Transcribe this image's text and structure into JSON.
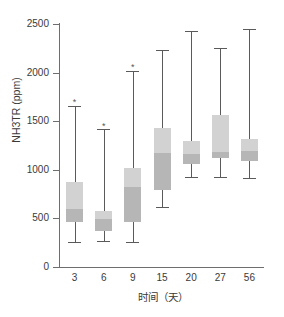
{
  "chart_data": {
    "type": "box",
    "title": "",
    "xlabel": "时间（天）",
    "ylabel": "NH3TR (ppm)",
    "ylim": [
      0,
      2500
    ],
    "yticks": [
      0,
      500,
      1000,
      1500,
      2000,
      2500
    ],
    "ytick_labels": [
      "0",
      "500",
      "1000",
      "1500",
      "2000",
      "2500"
    ],
    "categories": [
      "3",
      "6",
      "9",
      "15",
      "20",
      "27",
      "56"
    ],
    "grid": false,
    "legend": "none",
    "colors": {
      "box_upper": "#d2d2d2",
      "box_lower": "#b6b6b6",
      "line": "#5a5a5a",
      "axis": "#6e6e6e",
      "text": "#3a3a3a",
      "background": "#ffffff"
    },
    "boxes": [
      {
        "category": "3",
        "whisker_low": 260,
        "q1": 460,
        "median": 600,
        "q3": 870,
        "whisker_high": 1655,
        "outliers": [
          1715
        ]
      },
      {
        "category": "6",
        "whisker_low": 270,
        "q1": 375,
        "median": 490,
        "q3": 580,
        "whisker_high": 1415,
        "outliers": [
          1470
        ]
      },
      {
        "category": "9",
        "whisker_low": 255,
        "q1": 460,
        "median": 825,
        "q3": 1020,
        "whisker_high": 2015,
        "outliers": [
          2075
        ]
      },
      {
        "category": "15",
        "whisker_low": 620,
        "q1": 790,
        "median": 1175,
        "q3": 1430,
        "whisker_high": 2230,
        "outliers": []
      },
      {
        "category": "20",
        "whisker_low": 925,
        "q1": 1060,
        "median": 1165,
        "q3": 1300,
        "whisker_high": 2430,
        "outliers": []
      },
      {
        "category": "27",
        "whisker_low": 930,
        "q1": 1125,
        "median": 1180,
        "q3": 1560,
        "whisker_high": 2255,
        "outliers": []
      },
      {
        "category": "56",
        "whisker_low": 915,
        "q1": 1090,
        "median": 1195,
        "q3": 1320,
        "whisker_high": 2450,
        "outliers": []
      }
    ],
    "outlier_marker": "*"
  }
}
